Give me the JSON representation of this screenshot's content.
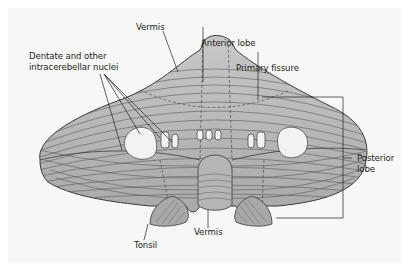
{
  "figure": {
    "labels": {
      "vermis_top": "Vermis",
      "anterior_lobe": "Anterior lobe",
      "primary_fissure": "Primary fissure",
      "nuclei_line1": "Dentate and other",
      "nuclei_line2": "intracerebellar nuclei",
      "posterior_lobe_line1": "Posterior",
      "posterior_lobe_line2": "lobe",
      "tonsil": "Tonsil",
      "vermis_bottom": "Vermis"
    },
    "colors": {
      "panel_background": "#f7f7f7",
      "tissue_fill": "#b9b9b9",
      "tissue_light": "#cfcfcf",
      "nuclei_fill": "#f2f2f2",
      "outline": "#3a3a3a",
      "folia_lines": "#5a5a5a",
      "label_text": "#231f20"
    }
  }
}
